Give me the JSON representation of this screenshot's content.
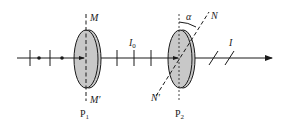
{
  "labels": {
    "M": "M",
    "M_prime": "M′",
    "P1": "P",
    "P1_sub": "1",
    "I0": "I",
    "I0_sub": "0",
    "alpha": "α",
    "N": "N",
    "N_prime": "N′",
    "P2": "P",
    "P2_sub": "2",
    "I": "I"
  },
  "colors": {
    "line": "#1a1a1a",
    "polarizer_fill": "#c8c8c8",
    "background": "#ffffff"
  }
}
